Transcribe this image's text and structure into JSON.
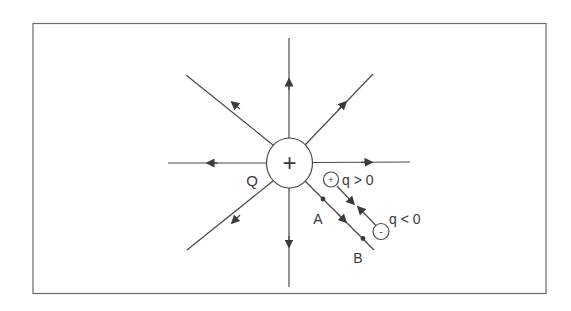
{
  "diagram": {
    "type": "electric-field-lines-point-charge",
    "colors": {
      "stroke": "#4a4a4a",
      "frame": "#6a6a6a",
      "text": "#3a3a3a",
      "background": "#ffffff"
    },
    "source_charge": {
      "label": "Q",
      "sign_symbol": "+"
    },
    "test_charges": [
      {
        "sign_symbol": "+",
        "label": "q > 0"
      },
      {
        "sign_symbol": "-",
        "label": "q < 0"
      }
    ],
    "points": [
      {
        "label": "A"
      },
      {
        "label": "B"
      }
    ],
    "field_line_directions": [
      "up",
      "down",
      "left",
      "right",
      "up-left",
      "up-right",
      "down-left",
      "down-right"
    ]
  }
}
